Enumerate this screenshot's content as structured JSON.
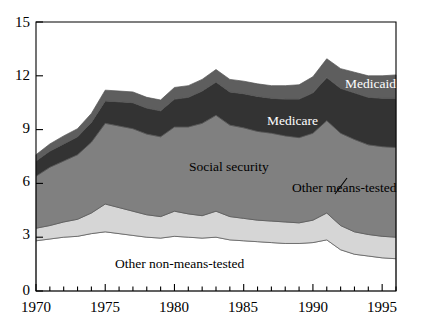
{
  "chart_data": {
    "type": "area",
    "stacked": true,
    "title": "",
    "subtitle": "",
    "xlabel": "",
    "ylabel": "",
    "grid": false,
    "legend_position": "inline-annotations",
    "xlim": [
      1970,
      1996
    ],
    "ylim": [
      0,
      15
    ],
    "yticks": [
      0,
      3,
      6,
      9,
      12,
      15
    ],
    "ytick_labels": [
      "0",
      "3",
      "6",
      "9",
      "12",
      "15"
    ],
    "xticks": [
      1970,
      1975,
      1980,
      1985,
      1990,
      1995
    ],
    "xtick_labels": [
      "1970",
      "1975",
      "1980",
      "1985",
      "1990",
      "1995"
    ],
    "x_minor_tick_step": 1,
    "x": [
      1970,
      1971,
      1972,
      1973,
      1974,
      1975,
      1976,
      1977,
      1978,
      1979,
      1980,
      1981,
      1982,
      1983,
      1984,
      1985,
      1986,
      1987,
      1988,
      1989,
      1990,
      1991,
      1992,
      1993,
      1994,
      1995,
      1996
    ],
    "series": [
      {
        "name": "Other non-means-tested",
        "label": "Other non-means-tested",
        "color": "#ffffff",
        "values": [
          2.8,
          2.9,
          3.0,
          3.05,
          3.2,
          3.3,
          3.2,
          3.1,
          3.0,
          2.95,
          3.05,
          3.0,
          2.95,
          3.0,
          2.85,
          2.8,
          2.75,
          2.7,
          2.65,
          2.65,
          2.7,
          2.85,
          2.3,
          2.05,
          1.95,
          1.85,
          1.8
        ]
      },
      {
        "name": "Other means-tested",
        "label": "Other means-tested",
        "color": "#d6d6d6",
        "values": [
          0.7,
          0.75,
          0.85,
          0.95,
          1.15,
          1.55,
          1.45,
          1.35,
          1.25,
          1.2,
          1.4,
          1.3,
          1.25,
          1.45,
          1.3,
          1.25,
          1.2,
          1.2,
          1.2,
          1.15,
          1.25,
          1.5,
          1.35,
          1.25,
          1.2,
          1.2,
          1.2
        ]
      },
      {
        "name": "Social security",
        "label": "Social security",
        "color": "#808080",
        "values": [
          2.9,
          3.25,
          3.4,
          3.6,
          3.95,
          4.5,
          4.55,
          4.6,
          4.5,
          4.45,
          4.7,
          4.85,
          5.15,
          5.35,
          5.1,
          5.05,
          4.95,
          4.9,
          4.8,
          4.75,
          4.85,
          5.15,
          5.15,
          5.15,
          5.0,
          5.0,
          5.0
        ]
      },
      {
        "name": "Medicare",
        "label": "Medicare",
        "color": "#333333",
        "values": [
          0.85,
          0.9,
          0.95,
          1.0,
          1.1,
          1.25,
          1.35,
          1.45,
          1.45,
          1.45,
          1.55,
          1.65,
          1.8,
          1.85,
          1.85,
          1.9,
          1.95,
          1.95,
          2.05,
          2.15,
          2.25,
          2.4,
          2.5,
          2.6,
          2.65,
          2.7,
          2.75
        ]
      },
      {
        "name": "Medicaid",
        "label": "Medicaid",
        "color": "#5e5e5e",
        "values": [
          0.35,
          0.4,
          0.45,
          0.45,
          0.5,
          0.6,
          0.6,
          0.6,
          0.6,
          0.6,
          0.65,
          0.65,
          0.65,
          0.7,
          0.7,
          0.7,
          0.7,
          0.7,
          0.75,
          0.8,
          0.9,
          1.05,
          1.1,
          1.15,
          1.2,
          1.25,
          1.3
        ]
      }
    ],
    "annotations": [
      {
        "name": "other-means-tested-annotation",
        "text": "Other means-tested",
        "has_leader_line": true
      }
    ]
  },
  "labels": {
    "medicaid": "Medicaid",
    "medicare": "Medicare",
    "social_security": "Social security",
    "other_means_tested": "Other means-tested",
    "other_non_means_tested": "Other non-means-tested"
  },
  "axis": {
    "y": [
      "15",
      "12",
      "9",
      "6",
      "3",
      "0"
    ],
    "x": [
      "1970",
      "1975",
      "1980",
      "1985",
      "1990",
      "1995"
    ]
  },
  "colors": {
    "medicaid": "#5e5e5e",
    "medicare": "#333333",
    "social_security": "#808080",
    "other_means_tested": "#d6d6d6",
    "other_non_means_tested": "#ffffff",
    "axis": "#000000",
    "outline": "#555555"
  }
}
